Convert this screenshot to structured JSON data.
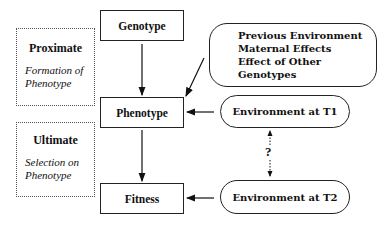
{
  "diagram": {
    "nodes": {
      "genotype": "Genotype",
      "phenotype": "Phenotype",
      "fitness": "Fitness",
      "env_t1": "Environment at T1",
      "env_t2": "Environment at T2"
    },
    "influences": {
      "lines": [
        "Previous Environment",
        "Maternal Effects",
        "Effect of Other Genotypes"
      ]
    },
    "proximate": {
      "title": "Proximate",
      "subtitle_1": "Formation of",
      "subtitle_2": "Phenotype"
    },
    "ultimate": {
      "title": "Ultimate",
      "subtitle_1": "Selection on",
      "subtitle_2": "Phenotype"
    },
    "link_label": "?"
  }
}
